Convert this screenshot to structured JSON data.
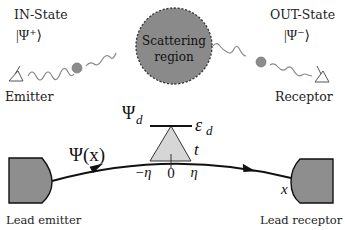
{
  "diagram": {
    "top": {
      "in_state": {
        "title": "IN-State",
        "ket": "|Ψ⁺⟩"
      },
      "out_state": {
        "title": "OUT-State",
        "ket": "|Ψ⁻⟩"
      },
      "scattering_region": {
        "line1": "Scattering",
        "line2": "region"
      },
      "emitter_label": "Emitter",
      "receptor_label": "Receptor"
    },
    "bottom": {
      "wavefunction_label": "Ψ(x)",
      "dot_state_label": "Ψ",
      "dot_state_sub": "d",
      "dot_energy_label": "ε",
      "dot_energy_sub": "d",
      "coupling_label": "t",
      "coord_left": "−η",
      "coord_center": "0",
      "coord_right": "η",
      "x_label": "x",
      "lead_emitter_label": "Lead emitter",
      "lead_receptor_label": "Lead receptor"
    },
    "colors": {
      "scattering_fill": "#8a8a8a",
      "dot_fill": "#8c8c8c",
      "lead_fill": "#8e8e8e",
      "triangle_fill": "#d6d6d6",
      "wave_stroke": "#808080",
      "line": "#111111"
    }
  }
}
